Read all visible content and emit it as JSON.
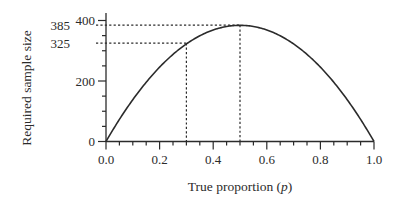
{
  "chart_data": {
    "type": "line",
    "title": "",
    "xlabel": "True proportion (p)",
    "xlabel_parts": {
      "text": "True proportion (",
      "var": "p",
      "close": ")"
    },
    "ylabel": "Required sample size",
    "xlim": [
      0.0,
      1.0
    ],
    "ylim": [
      0,
      400
    ],
    "x_ticks": [
      "0.0",
      "0.2",
      "0.4",
      "0.6",
      "0.8",
      "1.0"
    ],
    "x_tick_values": [
      0.0,
      0.2,
      0.4,
      0.6,
      0.8,
      1.0
    ],
    "x_minor_step": 0.05,
    "y_ticks": [
      "0",
      "200",
      "400"
    ],
    "y_tick_values": [
      0,
      200,
      400
    ],
    "y_minor_step": 50,
    "grid": false,
    "legend": null,
    "series": [
      {
        "name": "Required sample size",
        "formula": "n = 1.96^2 * p(1-p) / 0.05^2",
        "x": [
          0.0,
          0.05,
          0.1,
          0.15,
          0.2,
          0.25,
          0.3,
          0.35,
          0.4,
          0.45,
          0.5,
          0.55,
          0.6,
          0.65,
          0.7,
          0.75,
          0.8,
          0.85,
          0.9,
          0.95,
          1.0
        ],
        "values": [
          0,
          73,
          138,
          196,
          246,
          288,
          323,
          350,
          369,
          380,
          384,
          380,
          369,
          350,
          323,
          288,
          246,
          196,
          138,
          73,
          0
        ]
      }
    ],
    "annotations": [
      {
        "type": "reference-line",
        "label": "385",
        "y": 385,
        "x_from": 0.0,
        "x_to": 0.5,
        "style": "dotted"
      },
      {
        "type": "reference-line",
        "label": "325",
        "y": 325,
        "x_from": 0.0,
        "x_to": 0.3,
        "style": "dotted"
      },
      {
        "type": "reference-line",
        "x": 0.5,
        "y_from": 0,
        "y_to": 385,
        "style": "dotted"
      },
      {
        "type": "reference-line",
        "x": 0.3,
        "y_from": 0,
        "y_to": 325,
        "style": "dotted"
      }
    ],
    "colors": {
      "line": "#2b2b2b",
      "axis": "#2b2b2b",
      "background": "#ffffff"
    }
  }
}
